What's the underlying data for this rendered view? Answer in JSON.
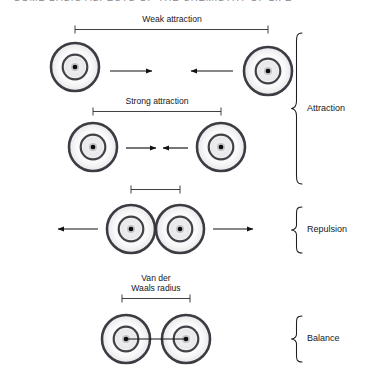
{
  "caption": {
    "clipped_header_text": "SOME BASIC ASPECTS OF THE CHEMISTRY OF LIFE"
  },
  "diagram": {
    "ink_color": "#17171c",
    "nucleus_color": "#0b0b0e",
    "shell_color": "#33333a"
  },
  "dimension_labels": {
    "weak_attraction": "Weak attraction",
    "strong_attraction": "Strong attraction",
    "repulsion_distance": "",
    "van_der_waals_radius_line1": "Van der",
    "van_der_waals_radius_line2": "Waals radius"
  },
  "brace_labels": {
    "attraction": "Attraction",
    "repulsion": "Repulsion",
    "balance": "Balance"
  },
  "rows": [
    {
      "id": "row-weak-attraction",
      "label": "Weak attraction",
      "separation": "far",
      "force_direction": "inward",
      "atom_count": 2
    },
    {
      "id": "row-strong-attraction",
      "label": "Strong attraction",
      "separation": "medium",
      "force_direction": "inward",
      "atom_count": 2
    },
    {
      "id": "row-repulsion",
      "label": "",
      "separation": "overlapping",
      "force_direction": "outward",
      "atom_count": 2
    },
    {
      "id": "row-balance",
      "label": "Van der Waals radius",
      "separation": "equilibrium",
      "force_direction": "none",
      "atom_count": 2
    }
  ]
}
